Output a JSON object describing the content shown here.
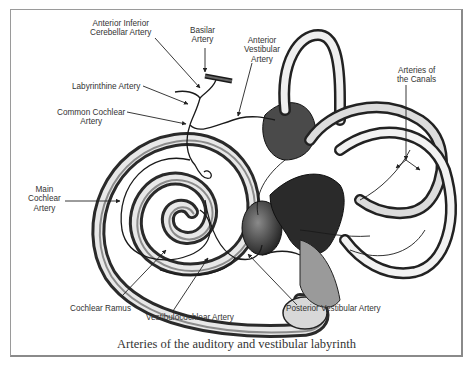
{
  "figure": {
    "caption": "Arteries of the auditory and vestibular labyrinth",
    "labels": {
      "anterior_inferior_cerebellar": "Anterior Inferior\nCerebellar Artery",
      "basilar": "Basilar\nArtery",
      "anterior_vestibular": "Anterior\nVestibular\nArtery",
      "labyrinthine": "Labyrinthine Artery",
      "common_cochlear": "Common Cochlear\nArtery",
      "arteries_of_canals": "Arteries of\nthe Canals",
      "main_cochlear": "Main\nCochlear\nArtery",
      "cochlear_ramus": "Cochlear Ramus",
      "vestibulocochlear": "Vestibulocochlear Artery",
      "posterior_vestibular": "Posterior Vestibular Artery"
    }
  }
}
